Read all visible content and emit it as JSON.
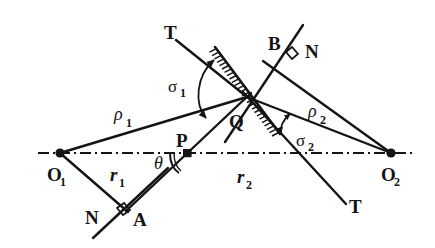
{
  "figure": {
    "kind": "geometry-diagram",
    "background_color": "#ffffff",
    "ink_color": "#141414",
    "width": 435,
    "height": 248
  },
  "labels": {
    "o1": {
      "text": "O",
      "sub": "1",
      "x": 47,
      "y": 180
    },
    "o2": {
      "text": "O",
      "sub": "2",
      "x": 381,
      "y": 180
    },
    "p": {
      "text": "P",
      "x": 176,
      "y": 147
    },
    "q": {
      "text": "Q",
      "x": 230,
      "y": 127
    },
    "a": {
      "text": "A",
      "x": 133,
      "y": 225
    },
    "b": {
      "text": "B",
      "x": 269,
      "y": 50
    },
    "n_lower_left": {
      "text": "N",
      "x": 86,
      "y": 223
    },
    "n_upper_right": {
      "text": "N",
      "x": 306,
      "y": 57
    },
    "t_upper_left": {
      "text": "T",
      "x": 165,
      "y": 38
    },
    "t_lower_right": {
      "text": "T",
      "x": 350,
      "y": 212
    },
    "rho1": {
      "text": "ρ",
      "sub": "1",
      "x": 115,
      "y": 120
    },
    "rho2": {
      "text": "ρ",
      "sub": "2",
      "x": 309,
      "y": 117
    },
    "r1": {
      "text": "r",
      "sub": "1",
      "x": 110,
      "y": 180
    },
    "r2": {
      "text": "r",
      "sub": "2",
      "x": 237,
      "y": 182
    },
    "sigma1": {
      "text": "σ",
      "sub": "1",
      "x": 169,
      "y": 91
    },
    "sigma2": {
      "text": "σ",
      "sub": "2",
      "x": 297,
      "y": 145
    },
    "theta": {
      "text": "θ",
      "x": 157,
      "y": 167
    }
  },
  "points": {
    "O1": {
      "x": 60,
      "y": 153
    },
    "O2": {
      "x": 391,
      "y": 153
    },
    "P": {
      "x": 187,
      "y": 153
    },
    "Q": {
      "x": 247,
      "y": 97
    }
  },
  "axis": {
    "name": "optical-axis",
    "style": "dash-dot",
    "x_start": 38,
    "x_end": 414,
    "y": 153
  },
  "segments": {
    "rho1_line": {
      "from": "O1",
      "to": "Q",
      "x1": 60,
      "y1": 153,
      "x2": 247,
      "y2": 97
    },
    "rho2_line": {
      "from": "Q",
      "to": "O2",
      "x1": 247,
      "y1": 97,
      "x2": 391,
      "y2": 153
    },
    "r1_line": {
      "from": "O1",
      "to": "A",
      "x1": 60,
      "y1": 153,
      "x2": 126,
      "y2": 210
    },
    "r2_line": {
      "from": "P",
      "to": "Q",
      "x1": 187,
      "y1": 153,
      "x2": 247,
      "y2": 97
    },
    "normal1": {
      "name": "N-A-through-O1",
      "x1": 93,
      "y1": 237,
      "x2": 166,
      "y2": 170
    },
    "normal1_ray": {
      "name": "A-to-Q-ray",
      "x1": 126,
      "y1": 210,
      "x2": 247,
      "y2": 97
    },
    "normal2": {
      "name": "N-B-to-O2",
      "x1": 264,
      "y1": 60,
      "x2": 391,
      "y2": 153
    },
    "normal2_ray": {
      "name": "B-ray-through-Q",
      "x1": 301,
      "y1": 27,
      "x2": 228,
      "y2": 138
    },
    "tangent_TT": {
      "name": "hatched-tangent",
      "x1": 215,
      "y1": 48,
      "x2": 279,
      "y2": 133
    },
    "t_ray_lower": {
      "name": "T-lower-right-ray",
      "x1": 247,
      "y1": 97,
      "x2": 345,
      "y2": 203
    }
  },
  "markers": {
    "right_angle_A": {
      "x": 122,
      "y": 211,
      "label": "right-angle"
    },
    "right_angle_B": {
      "x": 291,
      "y": 54,
      "label": "right-angle"
    },
    "hatching_side": "lower-left",
    "hatch_count": 26
  },
  "angles": {
    "sigma1": {
      "between": [
        "tangent-TT",
        "rho1"
      ],
      "vertex": "Q"
    },
    "sigma2": {
      "between": [
        "rho2",
        "T-lower-ray"
      ],
      "vertex": "Q"
    },
    "theta": {
      "between": [
        "optical-axis",
        "PQ"
      ],
      "vertex": "P"
    }
  }
}
